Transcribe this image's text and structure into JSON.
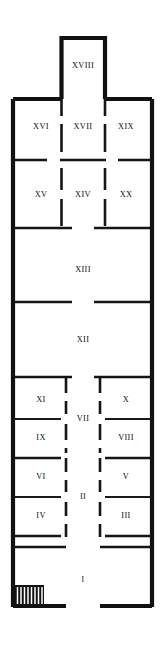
{
  "diagram": {
    "kind": "architectural-floor-plan",
    "orientation": "vertical",
    "canvas": {
      "width": 164,
      "height": 650
    },
    "colors": {
      "background": "#ffffff",
      "wall": "#111111",
      "label": "#0d0d0d",
      "stair_fill": "#111111",
      "stair_hatch": "#ffffff"
    },
    "line_styles": {
      "outer_wall": "solid-thick",
      "partition_wall": "solid-medium",
      "door_gap": "dashed-break"
    }
  },
  "rooms": [
    {
      "id": "r18",
      "label": "XVIII",
      "cx": 83,
      "cy": 66,
      "size": "normal",
      "zone": "north-projection"
    },
    {
      "id": "r16",
      "label": "XVI",
      "cx": 41,
      "cy": 127,
      "size": "normal",
      "zone": "upper-block"
    },
    {
      "id": "r17",
      "label": "XVII",
      "cx": 83,
      "cy": 127,
      "size": "normal",
      "zone": "upper-block"
    },
    {
      "id": "r19",
      "label": "XIX",
      "cx": 126,
      "cy": 127,
      "size": "normal",
      "zone": "upper-block"
    },
    {
      "id": "r15",
      "label": "XV",
      "cx": 41,
      "cy": 195,
      "size": "normal",
      "zone": "upper-block"
    },
    {
      "id": "r14",
      "label": "XIV",
      "cx": 83,
      "cy": 195,
      "size": "normal",
      "zone": "upper-block"
    },
    {
      "id": "r20",
      "label": "XX",
      "cx": 126,
      "cy": 195,
      "size": "normal",
      "zone": "upper-block"
    },
    {
      "id": "r13",
      "label": "XIII",
      "cx": 83,
      "cy": 270,
      "size": "normal",
      "zone": "hall"
    },
    {
      "id": "r12",
      "label": "XII",
      "cx": 83,
      "cy": 340,
      "size": "normal",
      "zone": "hall"
    },
    {
      "id": "r11",
      "label": "XI",
      "cx": 41,
      "cy": 400,
      "size": "normal",
      "zone": "west-range"
    },
    {
      "id": "r10",
      "label": "X",
      "cx": 126,
      "cy": 400,
      "size": "normal",
      "zone": "east-range"
    },
    {
      "id": "r7",
      "label": "VII",
      "cx": 83,
      "cy": 419,
      "size": "normal",
      "zone": "corridor"
    },
    {
      "id": "r9",
      "label": "IX",
      "cx": 41,
      "cy": 438,
      "size": "normal",
      "zone": "west-range"
    },
    {
      "id": "r8",
      "label": "VIII",
      "cx": 126,
      "cy": 438,
      "size": "normal",
      "zone": "east-range"
    },
    {
      "id": "r6",
      "label": "VI",
      "cx": 41,
      "cy": 477,
      "size": "normal",
      "zone": "west-range"
    },
    {
      "id": "r5",
      "label": "V",
      "cx": 126,
      "cy": 477,
      "size": "normal",
      "zone": "east-range"
    },
    {
      "id": "r2",
      "label": "II",
      "cx": 83,
      "cy": 497,
      "size": "normal",
      "zone": "corridor"
    },
    {
      "id": "r4",
      "label": "IV",
      "cx": 41,
      "cy": 516,
      "size": "normal",
      "zone": "west-range"
    },
    {
      "id": "r3",
      "label": "III",
      "cx": 126,
      "cy": 516,
      "size": "normal",
      "zone": "east-range"
    },
    {
      "id": "r1",
      "label": "I",
      "cx": 83,
      "cy": 580,
      "size": "small",
      "zone": "vestibule"
    }
  ],
  "features": [
    {
      "id": "staircase",
      "name": "staircase",
      "type": "hatched-stair-block",
      "x": 14,
      "y": 585,
      "width": 30,
      "height": 21,
      "step_count": 8
    },
    {
      "id": "main-entrance",
      "name": "main-entrance-gap",
      "type": "wall-gap",
      "location": "south-wall-center"
    }
  ]
}
